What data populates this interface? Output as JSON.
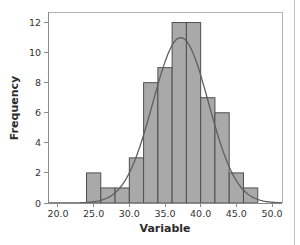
{
  "chart_data": {
    "type": "bar",
    "subtype": "histogram-with-normal-curve",
    "title": "",
    "xlabel": "Variable",
    "ylabel": "Frequency",
    "bin_width": 2,
    "bin_edges": [
      24,
      26,
      28,
      30,
      32,
      34,
      36,
      38,
      40,
      42,
      44,
      46,
      48
    ],
    "values": [
      2,
      1,
      1,
      3,
      8,
      9,
      12,
      12,
      7,
      6,
      2,
      1
    ],
    "total_n": 64,
    "x_ticks": [
      20,
      25,
      30,
      35,
      40,
      45,
      50
    ],
    "x_tick_labels": [
      "20.0",
      "25.0",
      "30.0",
      "35.0",
      "40.0",
      "45.0",
      "50.0"
    ],
    "y_ticks": [
      0,
      2,
      4,
      6,
      8,
      10,
      12
    ],
    "y_tick_labels": [
      "0",
      "2",
      "4",
      "6",
      "8",
      "10",
      "12"
    ],
    "xlim": [
      18.6,
      51.4
    ],
    "ylim": [
      0,
      12.7
    ],
    "grid": false,
    "legend_position": "none",
    "normal_curve": {
      "mean": 37.2,
      "sd": 3.9,
      "peak": 11
    },
    "colors": {
      "bar_fill": "#a9a9a9",
      "bar_stroke": "#4f4f4f",
      "curve": "#5f5f5f",
      "axis": "#8c8c8c",
      "frame": "#b3b3b3",
      "tick_label": "#333333",
      "axis_title": "#2b2b2b",
      "background": "#ffffff",
      "page_edge": "#c2c2c2"
    }
  }
}
